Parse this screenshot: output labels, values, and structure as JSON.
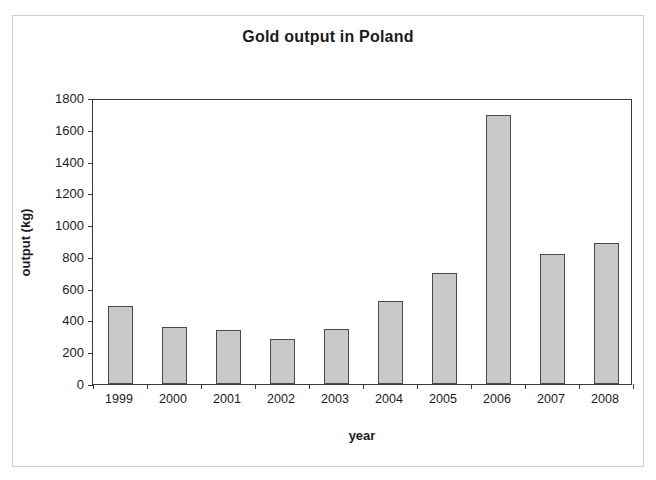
{
  "chart_data": {
    "type": "bar",
    "title": "Gold output in Poland",
    "xlabel": "year",
    "ylabel": "output (kg)",
    "categories": [
      "1999",
      "2000",
      "2001",
      "2002",
      "2003",
      "2004",
      "2005",
      "2006",
      "2007",
      "2008"
    ],
    "values": [
      490,
      360,
      340,
      285,
      345,
      520,
      700,
      1690,
      820,
      885
    ],
    "ylim": [
      0,
      1800
    ],
    "ytick_labels": [
      "0",
      "200",
      "400",
      "600",
      "800",
      "1000",
      "1200",
      "1400",
      "1600",
      "1800"
    ],
    "ytick_values": [
      0,
      200,
      400,
      600,
      800,
      1000,
      1200,
      1400,
      1600,
      1800
    ],
    "grid": false,
    "legend": null,
    "bar_color": "#c9c9c9",
    "bar_border_color": "#4a4a4a",
    "axis_color": "#3a3a3a",
    "background_color": "#ffffff",
    "frame_color": "#cfcfcf"
  }
}
